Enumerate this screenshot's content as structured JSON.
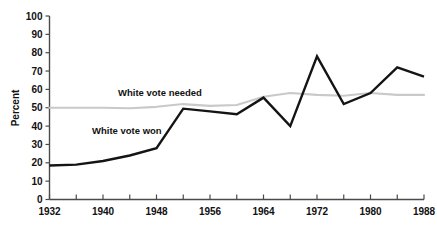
{
  "chart_data": {
    "type": "line",
    "title": "",
    "subtitle": "",
    "xlabel": "",
    "ylabel": "Percent",
    "xlim": [
      1932,
      1988
    ],
    "ylim": [
      0,
      100
    ],
    "grid": false,
    "legend_position": "inline-annotation",
    "x": [
      1932,
      1936,
      1940,
      1944,
      1948,
      1952,
      1956,
      1960,
      1964,
      1968,
      1972,
      1976,
      1980,
      1984,
      1988
    ],
    "x_tick_labels": [
      "1932",
      "1940",
      "1948",
      "1956",
      "1964",
      "1972",
      "1980",
      "1988"
    ],
    "x_tick_values": [
      1932,
      1940,
      1948,
      1956,
      1964,
      1972,
      1980,
      1988
    ],
    "x_minor_tick_values": [
      1936,
      1944,
      1952,
      1960,
      1968,
      1976,
      1984
    ],
    "y_tick_labels": [
      "0",
      "10",
      "20",
      "30",
      "40",
      "50",
      "60",
      "70",
      "80",
      "90",
      "100"
    ],
    "y_tick_values": [
      0,
      10,
      20,
      30,
      40,
      50,
      60,
      70,
      80,
      90,
      100
    ],
    "series": [
      {
        "name": "White vote won",
        "color": "#141414",
        "annotation": "White vote won",
        "values": [
          18.5,
          19,
          21,
          24,
          28,
          49.5,
          48,
          46.5,
          55.5,
          40,
          78,
          52,
          58,
          72,
          67
        ]
      },
      {
        "name": "White vote needed",
        "color": "#c9c9c9",
        "annotation": "White vote needed",
        "values": [
          50,
          50,
          50,
          49.7,
          50.5,
          52,
          51,
          51.5,
          56,
          58,
          57,
          56.5,
          58,
          57,
          57
        ]
      }
    ]
  },
  "annotations": {
    "needed_label": "White vote needed",
    "won_label": "White vote won"
  },
  "axes": {
    "y_axis_title": "Percent"
  },
  "colors": {
    "won_line": "#141414",
    "needed_line": "#c9c9c9",
    "axis": "#4a4a4a",
    "text": "#111111",
    "background": "#ffffff"
  }
}
